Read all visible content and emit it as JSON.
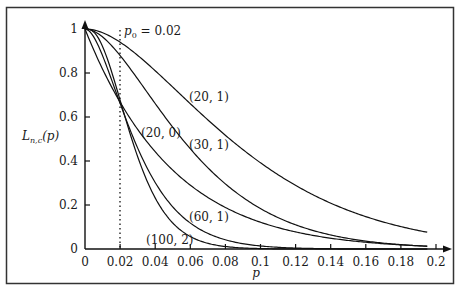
{
  "chart_data": {
    "type": "line",
    "title": "",
    "xlabel": "p",
    "ylabel": "L_{n,c}(p)",
    "xlim": [
      0,
      0.2
    ],
    "ylim": [
      0,
      1
    ],
    "grid": false,
    "legend_position": "inline curve labels",
    "x_ticks": [
      "0",
      "0.02",
      "0.04",
      "0.06",
      "0.08",
      "0.1",
      "0.12",
      "0.14",
      "0.16",
      "0.18",
      "0.2"
    ],
    "y_ticks": [
      "0",
      "0.2",
      "0.4",
      "0.6",
      "0.8",
      "1"
    ],
    "x": [
      0,
      0.02,
      0.04,
      0.06,
      0.08,
      0.1,
      0.12,
      0.14,
      0.16,
      0.18,
      0.2
    ],
    "series": [
      {
        "name": "(20,1)",
        "values": [
          1.0,
          0.94,
          0.81,
          0.66,
          0.517,
          0.392,
          0.289,
          0.209,
          0.147,
          0.102,
          0.069
        ]
      },
      {
        "name": "(30,1)",
        "values": [
          1.0,
          0.879,
          0.661,
          0.455,
          0.296,
          0.184,
          0.11,
          0.064,
          0.036,
          0.02,
          0.011
        ]
      },
      {
        "name": "(20,0)",
        "values": [
          1.0,
          0.668,
          0.442,
          0.29,
          0.189,
          0.122,
          0.078,
          0.049,
          0.031,
          0.019,
          0.012
        ]
      },
      {
        "name": "(60,1)",
        "values": [
          1.0,
          0.662,
          0.302,
          0.118,
          0.042,
          0.014,
          0.005,
          0.001,
          0.0,
          0.0,
          0.0
        ]
      },
      {
        "name": "(100,2)",
        "values": [
          1.0,
          0.677,
          0.232,
          0.057,
          0.011,
          0.002,
          0.0,
          0.0,
          0.0,
          0.0,
          0.0
        ]
      }
    ],
    "annotations": [
      {
        "text": "p_0 = 0.02",
        "type": "vertical dotted line",
        "x": 0.02
      }
    ]
  },
  "labels": {
    "y_axis": "L",
    "y_axis_sub": "n,c",
    "y_axis_arg": "(p)",
    "x_axis": "p",
    "p0_main": "p",
    "p0_sub": "0",
    "p0_value": " = 0.02",
    "curve_20_1": "(20, 1)",
    "curve_30_1": "(30, 1)",
    "curve_20_0": "(20, 0)",
    "curve_60_1": "(60, 1)",
    "curve_100_2": "(100, 2)"
  }
}
